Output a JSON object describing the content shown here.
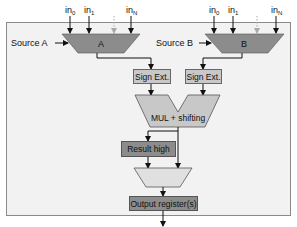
{
  "diagram": {
    "type": "block-diagram",
    "colors": {
      "frame_fill": "#f2f2f2",
      "frame_stroke": "#8a8a8a",
      "mux_fill": "#8c8c8c",
      "light_fill": "#c8c8c8",
      "result_fill": "#8c8c8c",
      "dashed_input": "#a9a9a9",
      "line": "#111111"
    },
    "sources": [
      {
        "id": "A",
        "label": "Source A",
        "mux_label": "A",
        "inputs": [
          {
            "base": "in",
            "sub": "0"
          },
          {
            "base": "in",
            "sub": "1"
          },
          {
            "base": "in",
            "sub": "N"
          }
        ]
      },
      {
        "id": "B",
        "label": "Source B",
        "mux_label": "B",
        "inputs": [
          {
            "base": "in",
            "sub": "0"
          },
          {
            "base": "in",
            "sub": "1"
          },
          {
            "base": "in",
            "sub": "N"
          }
        ]
      }
    ],
    "sign_ext_a": "Sign Ext.",
    "sign_ext_b": "Sign Ext.",
    "mul": "MUL + shifting",
    "result_high": "Result high",
    "output_register": "Output register(s)"
  }
}
